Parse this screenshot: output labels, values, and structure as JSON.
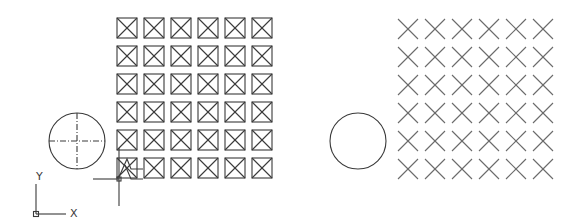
{
  "drawing": {
    "left_group": {
      "circle": {
        "cx": 77,
        "cy": 141,
        "r": 28,
        "centerlines": true
      },
      "grid": {
        "rows": 6,
        "cols": 6,
        "x0": 117,
        "y0": 18,
        "dx": 27,
        "dy": 28,
        "size": 20,
        "marker": "boxed-x"
      }
    },
    "right_group": {
      "circle": {
        "cx": 358,
        "cy": 141,
        "r": 28,
        "centerlines": false
      },
      "grid": {
        "rows": 6,
        "cols": 6,
        "x0": 398,
        "y0": 19,
        "dx": 27,
        "dy": 28,
        "size": 20,
        "marker": "x"
      }
    },
    "cursor": {
      "x": 119,
      "y": 179,
      "v_top": 148,
      "v_bottom": 206,
      "h_left": 93
    },
    "ucs_icon": {
      "origin_x": 36,
      "origin_y": 214,
      "x_label": "X",
      "y_label": "Y"
    }
  },
  "colors": {
    "stroke": "#3a3a3a",
    "stroke_light": "#6a6a6a",
    "background": "#ffffff"
  }
}
